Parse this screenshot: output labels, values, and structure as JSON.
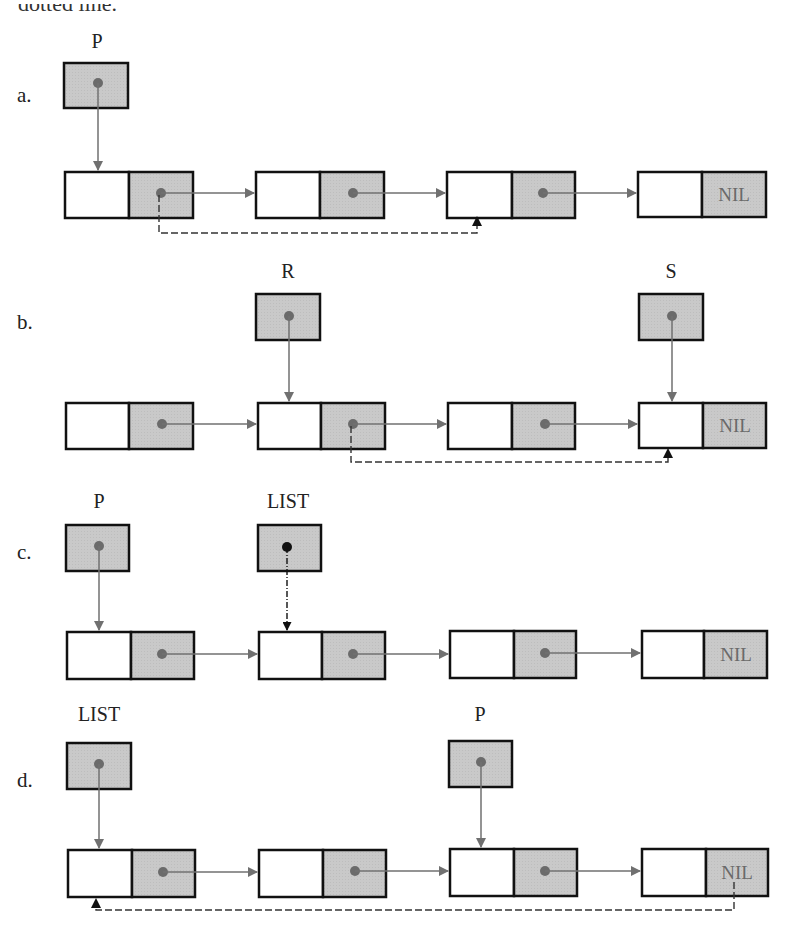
{
  "cutoff_text": "dotted line.",
  "colors": {
    "border": "#111111",
    "shaded": "#c9c9c9",
    "pointer": "#707070",
    "dot": "#6b6b6b",
    "dot_dark": "#111111",
    "nil_text": "#6a6a6a"
  },
  "panels": [
    {
      "label": "a.",
      "variables": [
        {
          "name": "P",
          "points_to_node": 1
        }
      ],
      "nodes": [
        {
          "info": "",
          "link": "pointer"
        },
        {
          "info": "",
          "link": "pointer"
        },
        {
          "info": "",
          "link": "pointer"
        },
        {
          "info": "",
          "link": "NIL"
        }
      ],
      "dashed_link": {
        "from_node": 1,
        "to_node": 3,
        "note": "new link bypassing node 2"
      }
    },
    {
      "label": "b.",
      "variables": [
        {
          "name": "R",
          "points_to_node": 2
        },
        {
          "name": "S",
          "points_to_node": 4
        }
      ],
      "nodes": [
        {
          "info": "",
          "link": "pointer"
        },
        {
          "info": "",
          "link": "pointer"
        },
        {
          "info": "",
          "link": "pointer"
        },
        {
          "info": "",
          "link": "NIL"
        }
      ],
      "dashed_link": {
        "from_node": 2,
        "to_node": 4,
        "note": "new link bypassing node 3"
      }
    },
    {
      "label": "c.",
      "variables": [
        {
          "name": "P",
          "points_to_node": 1
        },
        {
          "name": "LIST",
          "points_to_node": 2,
          "style": "dash-dot"
        }
      ],
      "nodes": [
        {
          "info": "",
          "link": "pointer"
        },
        {
          "info": "",
          "link": "pointer"
        },
        {
          "info": "",
          "link": "pointer"
        },
        {
          "info": "",
          "link": "NIL"
        }
      ]
    },
    {
      "label": "d.",
      "variables": [
        {
          "name": "LIST",
          "points_to_node": 1
        },
        {
          "name": "P",
          "points_to_node": 3
        }
      ],
      "nodes": [
        {
          "info": "",
          "link": "pointer"
        },
        {
          "info": "",
          "link": "pointer"
        },
        {
          "info": "",
          "link": "pointer"
        },
        {
          "info": "",
          "link": "NIL"
        }
      ],
      "dashed_link": {
        "from_node": 4,
        "to_node": 1,
        "note": "circular link from last node back to first"
      }
    }
  ],
  "nil_label": "NIL"
}
